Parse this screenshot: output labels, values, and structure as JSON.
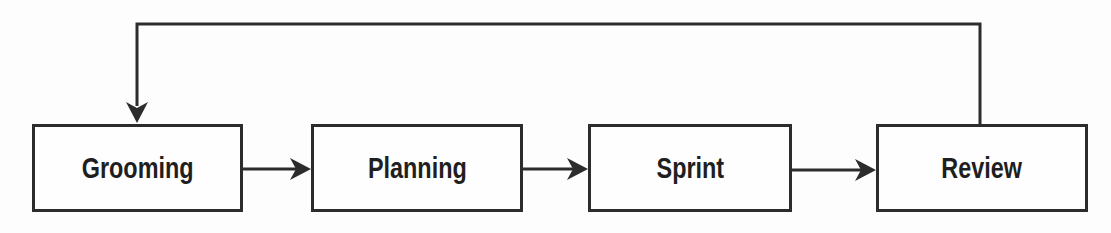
{
  "diagram_type": "flowchart",
  "colors": {
    "line": "#2c2c2c",
    "box_fill": "#fefefe",
    "text": "#1f1f1f",
    "background": "#fdfdfd"
  },
  "nodes": [
    {
      "id": "grooming",
      "label": "Grooming"
    },
    {
      "id": "planning",
      "label": "Planning"
    },
    {
      "id": "sprint",
      "label": "Sprint"
    },
    {
      "id": "review",
      "label": "Review"
    }
  ],
  "edges": [
    {
      "from": "Grooming",
      "to": "Planning",
      "style": "straight-arrow-right"
    },
    {
      "from": "Planning",
      "to": "Sprint",
      "style": "straight-arrow-right"
    },
    {
      "from": "Sprint",
      "to": "Review",
      "style": "straight-arrow-right"
    },
    {
      "from": "Review",
      "to": "Grooming",
      "style": "feedback-loop-over-top"
    }
  ]
}
